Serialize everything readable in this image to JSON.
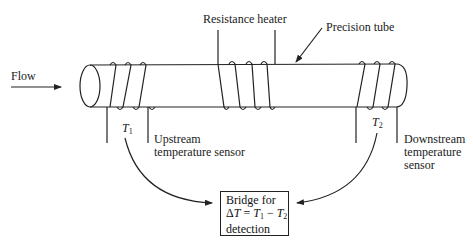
{
  "labels": {
    "flow": "Flow",
    "resistance_heater": "Resistance heater",
    "precision_tube": "Precision tube",
    "t1_symbol": "T",
    "t1_sub": "1",
    "t2_symbol": "T",
    "t2_sub": "2",
    "upstream_line1": "Upstream",
    "upstream_line2": "temperature sensor",
    "downstream_line1": "Downstream",
    "downstream_line2": "temperature",
    "downstream_line3": "sensor"
  },
  "bridge": {
    "line1": "Bridge for",
    "delta": "Δ",
    "T": "T",
    "eq": " = ",
    "T1": "T",
    "sub1": "1",
    "minus": " − ",
    "T2": "T",
    "sub2": "2",
    "line3": "detection"
  }
}
